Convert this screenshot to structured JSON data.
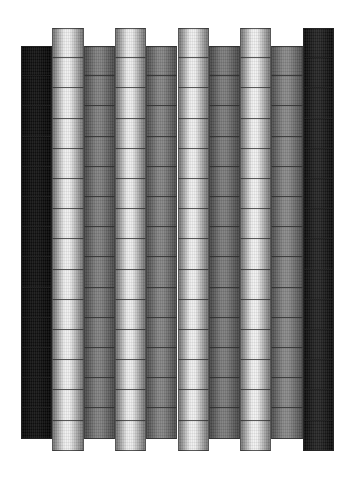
{
  "figure": {
    "background_color": "#ffffff",
    "width": 354,
    "height": 487,
    "artifact_label": ""
  },
  "chart_data": {
    "type": "heatmap",
    "subtitle": "",
    "xlabel": "",
    "ylabel": "",
    "grid": true,
    "legend": "none",
    "columns": 10,
    "rows": 14,
    "column_width": 31.3,
    "row_height": 30.2,
    "origin_x": 21,
    "origin_y": 28,
    "categories": [
      "C1",
      "C2",
      "C3",
      "C4",
      "C5",
      "C6",
      "C7",
      "C8",
      "C9",
      "C10"
    ],
    "series": [
      {
        "name": "column_base_luminance",
        "values": [
          16,
          238,
          126,
          236,
          130,
          238,
          122,
          240,
          134,
          34
        ]
      },
      {
        "name": "column_edge_luminance",
        "values": [
          4,
          120,
          74,
          118,
          78,
          120,
          72,
          122,
          80,
          10
        ]
      },
      {
        "name": "column_top_offset_px",
        "values": [
          18,
          0,
          18,
          0,
          18,
          0,
          18,
          0,
          18,
          0
        ]
      },
      {
        "name": "column_band_count",
        "values": [
          13,
          14,
          13,
          14,
          13,
          14,
          13,
          14,
          13,
          14
        ]
      }
    ],
    "column_colors_center": [
      "#101010",
      "#eeeeee",
      "#7e7e7e",
      "#ececec",
      "#828282",
      "#eeeeee",
      "#7a7a7a",
      "#f0f0f0",
      "#868686",
      "#222222"
    ],
    "column_colors_edge": [
      "#040404",
      "#787878",
      "#4a4a4a",
      "#767676",
      "#4e4e4e",
      "#787878",
      "#484848",
      "#7a7a7a",
      "#505050",
      "#0a0a0a"
    ],
    "band_divider_color": "#282828",
    "xlim": [
      21,
      334
    ],
    "ylim": [
      28,
      465
    ]
  }
}
